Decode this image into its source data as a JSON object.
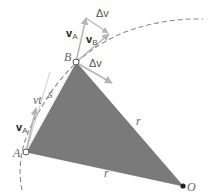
{
  "diagram": {
    "colors": {
      "triangle_fill": "#7a7a7a",
      "arc": "#888888",
      "vector": "#b5b5b5",
      "label": "#555555"
    },
    "points": {
      "A": {
        "label": "A",
        "x": 26,
        "y": 152
      },
      "B": {
        "label": "B",
        "x": 76,
        "y": 62
      },
      "O": {
        "label": "O",
        "x": 183,
        "y": 186
      }
    },
    "labels": {
      "vA_top": "v",
      "vA_top_sub": "A",
      "vB": "v",
      "vB_sub": "B",
      "delta_v_top": "Δv",
      "delta_v_mid": "Δv",
      "vA_bottom": "v",
      "vA_bottom_sub": "A",
      "vt": "vt",
      "s": "s",
      "r_right": "r",
      "r_bottom": "r"
    }
  }
}
